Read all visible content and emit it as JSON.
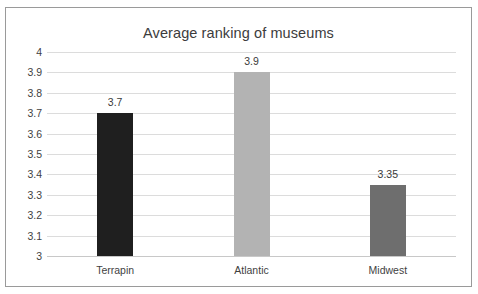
{
  "chart_data": {
    "type": "bar",
    "title": "Average ranking of museums",
    "categories": [
      "Terrapin",
      "Atlantic",
      "Midwest"
    ],
    "values": [
      3.7,
      3.9,
      3.35
    ],
    "data_labels": [
      "3.7",
      "3.9",
      "3.35"
    ],
    "bar_colors": [
      "#1f1f1f",
      "#b3b3b3",
      "#6e6e6e"
    ],
    "xlabel": "",
    "ylabel": "",
    "ylim": [
      3,
      4
    ],
    "y_ticks": [
      "4",
      "3.9",
      "3.8",
      "3.7",
      "3.6",
      "3.5",
      "3.4",
      "3.3",
      "3.2",
      "3.1",
      "3"
    ],
    "y_tick_values": [
      4,
      3.9,
      3.8,
      3.7,
      3.6,
      3.5,
      3.4,
      3.3,
      3.2,
      3.1,
      3
    ],
    "grid": true,
    "grid_color": "#dcdcdc",
    "legend": false,
    "legend_position": "none",
    "border_color": "#9a9a9a",
    "background": "#ffffff",
    "text_color": "#3f3f3f"
  }
}
